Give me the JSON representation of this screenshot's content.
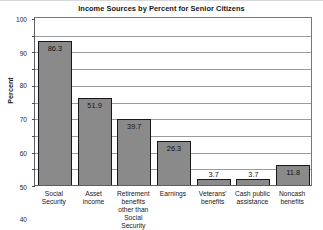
{
  "chart_data": {
    "type": "bar",
    "title": "Income Sources by Percent for Senior Citizens",
    "xlabel": "",
    "ylabel": "Percent",
    "ylim": [
      0,
      100
    ],
    "ytick_step": 10,
    "yticks": [
      100,
      90,
      80,
      70,
      60,
      50,
      40,
      30,
      20,
      10,
      0
    ],
    "grid": true,
    "legend": false,
    "categories": [
      "Social Security",
      "Asset income",
      "Retirement benefits other than Social Security",
      "Earnings",
      "Veterans' benefits",
      "Cash public assistance",
      "Noncash benefits"
    ],
    "category_lines": [
      [
        "Social",
        "Security"
      ],
      [
        "Asset",
        "income"
      ],
      [
        "Retirement",
        "benefits",
        "other than",
        "Social Security"
      ],
      [
        "Earnings"
      ],
      [
        "Veterans'",
        "benefits"
      ],
      [
        "Cash public",
        "assistance"
      ],
      [
        "Noncash",
        "benefits"
      ]
    ],
    "values": [
      86.3,
      51.9,
      39.7,
      26.3,
      3.7,
      3.7,
      11.8
    ],
    "value_labels": [
      "86.3",
      "51.9",
      "39.7",
      "26.3",
      "3.7",
      "3.7",
      "11.8"
    ],
    "value_label_position": [
      "inside",
      "inside",
      "inside",
      "inside",
      "above",
      "above",
      "inside"
    ],
    "bar_color": "#8a8a8a",
    "bar_edge_color": "#18181a",
    "grid_color": "#9b9b9f",
    "axis_color": "#5d5d63",
    "text_color": "#17171b",
    "background": "#ffffff"
  }
}
